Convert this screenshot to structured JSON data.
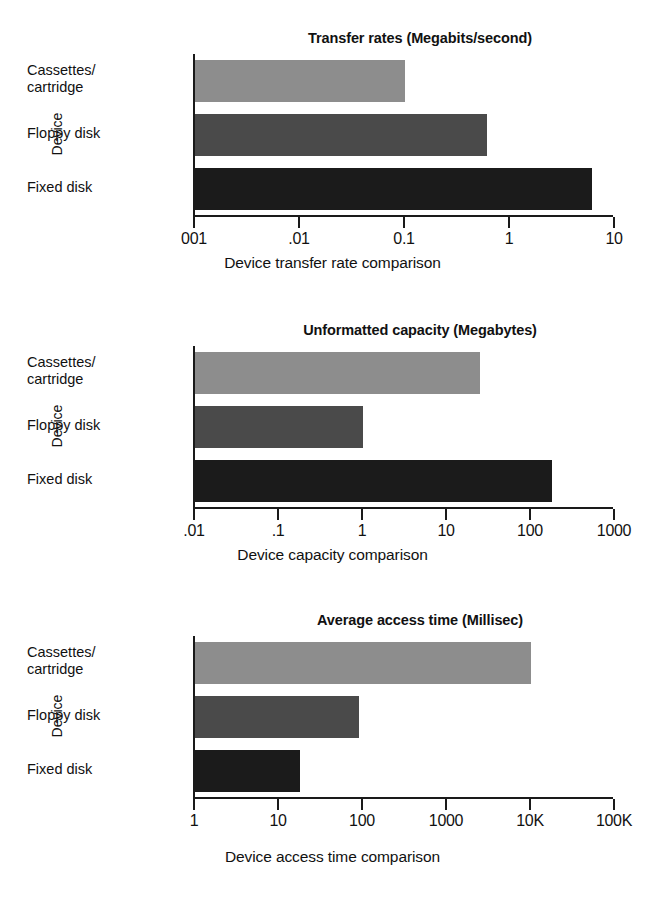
{
  "page": {
    "background": "#ffffff",
    "series_colors": [
      "#8d8d8d",
      "#4a4a4a",
      "#1b1b1b"
    ]
  },
  "charts": [
    {
      "title": "Transfer rates (Megabits/second)",
      "ylabel": "Device",
      "caption": "Device transfer rate comparison",
      "categories": [
        "Cassettes/\ncartridge",
        "Floppy disk",
        "Fixed disk"
      ],
      "ticklabels": [
        "001",
        ".01",
        "0.1",
        "1",
        "10"
      ],
      "values": [
        0.1,
        0.6,
        6
      ]
    },
    {
      "title": "Unformatted capacity (Megabytes)",
      "ylabel": "Device",
      "caption": "Device capacity comparison",
      "categories": [
        "Cassettes/\ncartridge",
        "Floppy disk",
        "Fixed disk"
      ],
      "ticklabels": [
        ".01",
        ".1",
        "1",
        "10",
        "100",
        "1000"
      ],
      "values": [
        25,
        1,
        180
      ]
    },
    {
      "title": "Average access time (Millisec)",
      "ylabel": "Device",
      "caption": "Device access time comparison",
      "categories": [
        "Cassettes/\ncartridge",
        "Floppy disk",
        "Fixed disk"
      ],
      "ticklabels": [
        "1",
        "10",
        "100",
        "1000",
        "10K",
        "100K"
      ],
      "values": [
        10000,
        90,
        18
      ]
    }
  ],
  "chart_data": [
    {
      "type": "bar",
      "orientation": "horizontal",
      "title": "Transfer rates (Megabits/second)",
      "xlabel": "Device transfer rate comparison",
      "ylabel": "Device",
      "xscale": "log",
      "xlim": [
        0.001,
        10
      ],
      "xticks": [
        0.001,
        0.01,
        0.1,
        1,
        10
      ],
      "xticklabels": [
        "001",
        ".01",
        "0.1",
        "1",
        "10"
      ],
      "categories": [
        "Cassettes/cartridge",
        "Floppy disk",
        "Fixed disk"
      ],
      "values": [
        0.1,
        0.6,
        6
      ],
      "units": "Megabits/second",
      "grid": false,
      "legend": "none"
    },
    {
      "type": "bar",
      "orientation": "horizontal",
      "title": "Unformatted capacity (Megabytes)",
      "xlabel": "Device capacity comparison",
      "ylabel": "Device",
      "xscale": "log",
      "xlim": [
        0.01,
        1000
      ],
      "xticks": [
        0.01,
        0.1,
        1,
        10,
        100,
        1000
      ],
      "xticklabels": [
        ".01",
        ".1",
        "1",
        "10",
        "100",
        "1000"
      ],
      "categories": [
        "Cassettes/cartridge",
        "Floppy disk",
        "Fixed disk"
      ],
      "values": [
        25,
        1,
        180
      ],
      "units": "Megabytes",
      "grid": false,
      "legend": "none"
    },
    {
      "type": "bar",
      "orientation": "horizontal",
      "title": "Average access time (Millisec)",
      "xlabel": "Device access time comparison",
      "ylabel": "Device",
      "xscale": "log",
      "xlim": [
        1,
        100000
      ],
      "xticks": [
        1,
        10,
        100,
        1000,
        10000,
        100000
      ],
      "xticklabels": [
        "1",
        "10",
        "100",
        "1000",
        "10K",
        "100K"
      ],
      "categories": [
        "Cassettes/cartridge",
        "Floppy disk",
        "Fixed disk"
      ],
      "values": [
        10000,
        90,
        18
      ],
      "units": "Milliseconds",
      "grid": false,
      "legend": "none"
    }
  ]
}
